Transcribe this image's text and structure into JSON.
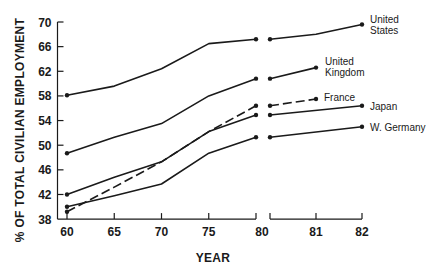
{
  "chart_data": {
    "type": "line",
    "title": "",
    "xlabel": "YEAR",
    "ylabel": "% OF TOTAL CIVILIAN EMPLOYMENT",
    "ylim": [
      38,
      70
    ],
    "y_ticks": [
      38,
      42,
      46,
      50,
      54,
      58,
      62,
      66,
      70
    ],
    "x_segments": [
      {
        "ticks": [
          "60",
          "65",
          "70",
          "75",
          "80"
        ],
        "years": [
          60,
          65,
          70,
          75,
          80
        ]
      },
      {
        "ticks": [
          "81",
          "82"
        ],
        "years": [
          80,
          81,
          82
        ]
      }
    ],
    "x_tick_labels": [
      "60",
      "65",
      "70",
      "75",
      "80",
      "81",
      "82"
    ],
    "grid": false,
    "legend_position": "inline-right",
    "series": [
      {
        "name": "United States",
        "label_lines": [
          "United",
          "States"
        ],
        "style": "solid",
        "segment1": {
          "x": [
            60,
            65,
            70,
            75,
            80
          ],
          "y": [
            58.1,
            59.6,
            62.4,
            66.5,
            67.2
          ]
        },
        "segment2": {
          "x": [
            80,
            81,
            82
          ],
          "y": [
            67.2,
            68.0,
            69.6
          ]
        }
      },
      {
        "name": "United Kingdom",
        "label_lines": [
          "United",
          "Kingdom"
        ],
        "style": "solid",
        "segment1": {
          "x": [
            60,
            65,
            70,
            75,
            80
          ],
          "y": [
            48.7,
            51.3,
            53.5,
            58.0,
            60.8
          ]
        },
        "segment2": {
          "x": [
            80,
            81
          ],
          "y": [
            60.8,
            62.6
          ]
        }
      },
      {
        "name": "France",
        "label_lines": [
          "France"
        ],
        "style": "dashed",
        "segment1": {
          "x": [
            60,
            65,
            70,
            75,
            80
          ],
          "y": [
            39.2,
            43.2,
            47.3,
            52.2,
            56.4
          ]
        },
        "segment2": {
          "x": [
            80,
            81
          ],
          "y": [
            56.4,
            57.5
          ]
        }
      },
      {
        "name": "Japan",
        "label_lines": [
          "Japan"
        ],
        "style": "solid",
        "segment1": {
          "x": [
            60,
            65,
            70,
            75,
            80
          ],
          "y": [
            42.0,
            44.8,
            47.3,
            52.2,
            54.9
          ]
        },
        "segment2": {
          "x": [
            80,
            82
          ],
          "y": [
            54.9,
            56.4
          ]
        }
      },
      {
        "name": "W. Germany",
        "label_lines": [
          "W. Germany"
        ],
        "style": "solid",
        "segment1": {
          "x": [
            60,
            65,
            70,
            75,
            80
          ],
          "y": [
            40.0,
            41.8,
            43.7,
            48.7,
            51.3
          ]
        },
        "segment2": {
          "x": [
            80,
            82
          ],
          "y": [
            51.3,
            53.0
          ]
        }
      }
    ]
  }
}
